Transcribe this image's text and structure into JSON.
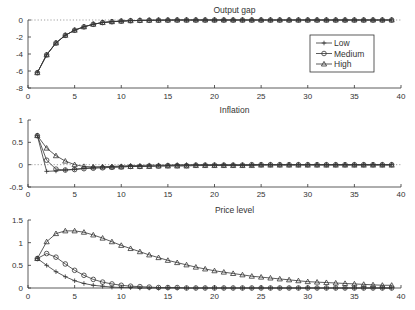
{
  "chart_data": [
    {
      "type": "line",
      "title": "Output gap",
      "xlabel": "",
      "ylabel": "",
      "xlim": [
        0,
        40
      ],
      "ylim": [
        -8,
        0
      ],
      "xticks": [
        0,
        5,
        10,
        15,
        20,
        25,
        30,
        35,
        40
      ],
      "yticks": [
        0,
        -2,
        -4,
        -6,
        -8
      ],
      "zero_line": true,
      "legend": {
        "position": "upper right",
        "entries": [
          "Low",
          "Medium",
          "High"
        ]
      },
      "x": [
        1,
        2,
        3,
        4,
        5,
        6,
        7,
        8,
        9,
        10,
        11,
        12,
        13,
        14,
        15,
        16,
        17,
        18,
        19,
        20,
        21,
        22,
        23,
        24,
        25,
        26,
        27,
        28,
        29,
        30,
        31,
        32,
        33,
        34,
        35,
        36,
        37,
        38,
        39
      ],
      "series": [
        {
          "name": "Low",
          "marker": "plus",
          "values": [
            -6.2,
            -4.1,
            -2.7,
            -1.8,
            -1.2,
            -0.8,
            -0.5,
            -0.3,
            -0.2,
            -0.13,
            -0.08,
            -0.05,
            -0.03,
            -0.02,
            -0.01,
            0,
            0,
            0,
            0,
            0,
            0,
            0,
            0,
            0,
            0,
            0,
            0,
            0,
            0,
            0,
            0,
            0,
            0,
            0,
            0,
            0,
            0,
            0,
            0
          ]
        },
        {
          "name": "Medium",
          "marker": "circle",
          "values": [
            -6.2,
            -4.1,
            -2.7,
            -1.8,
            -1.2,
            -0.8,
            -0.5,
            -0.3,
            -0.2,
            -0.13,
            -0.08,
            -0.05,
            -0.03,
            -0.02,
            -0.01,
            0,
            0,
            0,
            0,
            0,
            0,
            0,
            0,
            0,
            0,
            0,
            0,
            0,
            0,
            0,
            0,
            0,
            0,
            0,
            0,
            0,
            0,
            0,
            0
          ]
        },
        {
          "name": "High",
          "marker": "triangle",
          "values": [
            -6.2,
            -4.1,
            -2.7,
            -1.8,
            -1.2,
            -0.8,
            -0.5,
            -0.3,
            -0.2,
            -0.13,
            -0.08,
            -0.05,
            -0.03,
            -0.02,
            -0.01,
            0,
            0,
            0,
            0,
            0,
            0,
            0,
            0,
            0,
            0,
            0,
            0,
            0,
            0,
            0,
            0,
            0,
            0,
            0,
            0,
            0,
            0,
            0,
            0
          ]
        }
      ]
    },
    {
      "type": "line",
      "title": "Inflation",
      "xlabel": "",
      "ylabel": "",
      "xlim": [
        0,
        40
      ],
      "ylim": [
        -0.5,
        1
      ],
      "xticks": [
        0,
        5,
        10,
        15,
        20,
        25,
        30,
        35,
        40
      ],
      "yticks": [
        1,
        0.5,
        0,
        -0.5
      ],
      "zero_line": true,
      "x": [
        1,
        2,
        3,
        4,
        5,
        6,
        7,
        8,
        9,
        10,
        11,
        12,
        13,
        14,
        15,
        16,
        17,
        18,
        19,
        20,
        21,
        22,
        23,
        24,
        25,
        26,
        27,
        28,
        29,
        30,
        31,
        32,
        33,
        34,
        35,
        36,
        37,
        38,
        39
      ],
      "series": [
        {
          "name": "Low",
          "marker": "plus",
          "values": [
            0.65,
            -0.15,
            -0.14,
            -0.12,
            -0.1,
            -0.08,
            -0.06,
            -0.05,
            -0.04,
            -0.03,
            -0.02,
            -0.02,
            -0.01,
            -0.01,
            -0.01,
            0,
            0,
            0,
            0,
            0,
            0,
            0,
            0,
            0,
            0,
            0,
            0,
            0,
            0,
            0,
            0,
            0,
            0,
            0,
            0,
            0,
            0,
            0,
            0
          ]
        },
        {
          "name": "Medium",
          "marker": "circle",
          "values": [
            0.65,
            0.1,
            -0.1,
            -0.12,
            -0.11,
            -0.09,
            -0.08,
            -0.07,
            -0.06,
            -0.05,
            -0.04,
            -0.04,
            -0.03,
            -0.03,
            -0.02,
            -0.02,
            -0.02,
            -0.01,
            -0.01,
            -0.01,
            -0.01,
            -0.01,
            -0.01,
            0,
            0,
            0,
            0,
            0,
            0,
            0,
            0,
            0,
            0,
            0,
            0,
            0,
            0,
            0,
            0
          ]
        },
        {
          "name": "High",
          "marker": "triangle",
          "values": [
            0.65,
            0.37,
            0.2,
            0.08,
            0.0,
            -0.04,
            -0.05,
            -0.05,
            -0.05,
            -0.05,
            -0.04,
            -0.04,
            -0.04,
            -0.03,
            -0.03,
            -0.03,
            -0.03,
            -0.02,
            -0.02,
            -0.02,
            -0.02,
            -0.02,
            -0.02,
            -0.02,
            -0.01,
            -0.01,
            -0.01,
            -0.01,
            -0.01,
            -0.01,
            -0.01,
            -0.01,
            -0.01,
            -0.01,
            -0.01,
            -0.01,
            -0.01,
            -0.01,
            -0.01
          ]
        }
      ]
    },
    {
      "type": "line",
      "title": "Price level",
      "xlabel": "",
      "ylabel": "",
      "xlim": [
        0,
        40
      ],
      "ylim": [
        0,
        1.5
      ],
      "xticks": [
        0,
        5,
        10,
        15,
        20,
        25,
        30,
        35,
        40
      ],
      "yticks": [
        1.5,
        1,
        0.5,
        0
      ],
      "x": [
        1,
        2,
        3,
        4,
        5,
        6,
        7,
        8,
        9,
        10,
        11,
        12,
        13,
        14,
        15,
        16,
        17,
        18,
        19,
        20,
        21,
        22,
        23,
        24,
        25,
        26,
        27,
        28,
        29,
        30,
        31,
        32,
        33,
        34,
        35,
        36,
        37,
        38,
        39
      ],
      "series": [
        {
          "name": "Low",
          "marker": "plus",
          "values": [
            0.65,
            0.5,
            0.36,
            0.25,
            0.16,
            0.1,
            0.06,
            0.04,
            0.02,
            0.01,
            0.01,
            0,
            0,
            0,
            0,
            0,
            0,
            0,
            0,
            0,
            0,
            0,
            0,
            0,
            0,
            0,
            0,
            0,
            0,
            0,
            0,
            0,
            0,
            0,
            0,
            0,
            0,
            0,
            0
          ]
        },
        {
          "name": "Medium",
          "marker": "circle",
          "values": [
            0.65,
            0.76,
            0.68,
            0.53,
            0.39,
            0.28,
            0.19,
            0.13,
            0.09,
            0.06,
            0.04,
            0.03,
            0.02,
            0.01,
            0.01,
            0.01,
            0,
            0,
            0,
            0,
            0,
            0,
            0,
            0,
            0,
            0,
            0,
            0,
            0,
            0,
            0,
            0,
            0,
            0,
            0,
            0,
            0,
            0,
            0
          ]
        },
        {
          "name": "High",
          "marker": "triangle",
          "values": [
            0.65,
            1.02,
            1.2,
            1.26,
            1.26,
            1.23,
            1.17,
            1.1,
            1.02,
            0.94,
            0.87,
            0.8,
            0.73,
            0.67,
            0.61,
            0.56,
            0.51,
            0.46,
            0.42,
            0.38,
            0.35,
            0.32,
            0.29,
            0.26,
            0.24,
            0.22,
            0.2,
            0.18,
            0.16,
            0.14,
            0.13,
            0.12,
            0.11,
            0.1,
            0.09,
            0.08,
            0.07,
            0.06,
            0.06
          ]
        }
      ]
    }
  ],
  "panels_layout": [
    {
      "x0": 28,
      "x1": 401,
      "y_top": 20,
      "y_bottom": 88,
      "title_y": 13,
      "axis_label_y": 99
    },
    {
      "x0": 28,
      "x1": 401,
      "y_top": 120,
      "y_bottom": 187,
      "title_y": 113,
      "axis_label_y": 197
    },
    {
      "x0": 28,
      "x1": 401,
      "y_top": 220,
      "y_bottom": 288,
      "title_y": 213,
      "axis_label_y": 299
    }
  ],
  "legend_box": {
    "x": 310,
    "y": 35,
    "w": 64,
    "h": 37
  }
}
